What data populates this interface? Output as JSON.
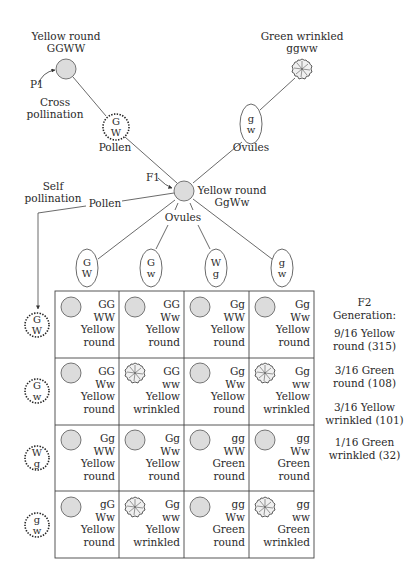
{
  "parents": {
    "p1_label": "P1",
    "yellow_round": {
      "phenotype": "Yellow round",
      "genotype": "GGWW"
    },
    "green_wrinkled": {
      "phenotype": "Green wrinkled",
      "genotype": "ggww"
    },
    "cross_label_1": "Cross",
    "cross_label_2": "pollination",
    "pollen_label": "Pollen",
    "pollen_gamete": [
      "G",
      "W"
    ],
    "ovules_label": "Ovules",
    "ovule_gamete": [
      "g",
      "w"
    ]
  },
  "f1": {
    "label": "F1",
    "phenotype": "Yellow round",
    "genotype": "GgWw",
    "self_label_1": "Self",
    "self_label_2": "pollination",
    "pollen_label": "Pollen",
    "ovules_label": "Ovules"
  },
  "ovule_gametes": [
    [
      "G",
      "W"
    ],
    [
      "G",
      "w"
    ],
    [
      "W",
      "g"
    ],
    [
      "g",
      "w"
    ]
  ],
  "pollen_gametes": [
    [
      "G",
      "W"
    ],
    [
      "G",
      "w"
    ],
    [
      "W",
      "g"
    ],
    [
      "g",
      "w"
    ]
  ],
  "grid": [
    [
      {
        "shape": "round",
        "g": "GG",
        "w": "WW",
        "color": "Yellow",
        "form": "round"
      },
      {
        "shape": "round",
        "g": "GG",
        "w": "Ww",
        "color": "Yellow",
        "form": "round"
      },
      {
        "shape": "round",
        "g": "Gg",
        "w": "WW",
        "color": "Yellow",
        "form": "round"
      },
      {
        "shape": "round",
        "g": "Gg",
        "w": "Ww",
        "color": "Yellow",
        "form": "round"
      }
    ],
    [
      {
        "shape": "round",
        "g": "GG",
        "w": "Ww",
        "color": "Yellow",
        "form": "round"
      },
      {
        "shape": "wrinkled",
        "g": "GG",
        "w": "ww",
        "color": "Yellow",
        "form": "wrinkled"
      },
      {
        "shape": "round",
        "g": "Gg",
        "w": "Ww",
        "color": "Yellow",
        "form": "round"
      },
      {
        "shape": "wrinkled",
        "g": "Gg",
        "w": "ww",
        "color": "Yellow",
        "form": "wrinkled"
      }
    ],
    [
      {
        "shape": "round",
        "g": "Gg",
        "w": "WW",
        "color": "Yellow",
        "form": "round"
      },
      {
        "shape": "round",
        "g": "Gg",
        "w": "Ww",
        "color": "Yellow",
        "form": "round"
      },
      {
        "shape": "round",
        "g": "gg",
        "w": "WW",
        "color": "Green",
        "form": "round"
      },
      {
        "shape": "round",
        "g": "gg",
        "w": "Ww",
        "color": "Green",
        "form": "round"
      }
    ],
    [
      {
        "shape": "round",
        "g": "gG",
        "w": "Ww",
        "color": "Yellow",
        "form": "round"
      },
      {
        "shape": "wrinkled",
        "g": "Gg",
        "w": "ww",
        "color": "Yellow",
        "form": "wrinkled"
      },
      {
        "shape": "round",
        "g": "gg",
        "w": "Ww",
        "color": "Green",
        "form": "round"
      },
      {
        "shape": "wrinkled",
        "g": "gg",
        "w": "ww",
        "color": "Green",
        "form": "wrinkled"
      }
    ]
  ],
  "f2_summary": {
    "title_1": "F2",
    "title_2": "Generation:",
    "ratios": [
      {
        "line1": "9/16 Yellow",
        "line2": "round (315)"
      },
      {
        "line1": "3/16 Green",
        "line2": "round (108)"
      },
      {
        "line1": "3/16 Yellow",
        "line2": "wrinkled (101)"
      },
      {
        "line1": "1/16 Green",
        "line2": "wrinkled (32)"
      }
    ]
  },
  "colors": {
    "seed_fill": "#dcdcdc",
    "line": "#3a3a3a"
  }
}
